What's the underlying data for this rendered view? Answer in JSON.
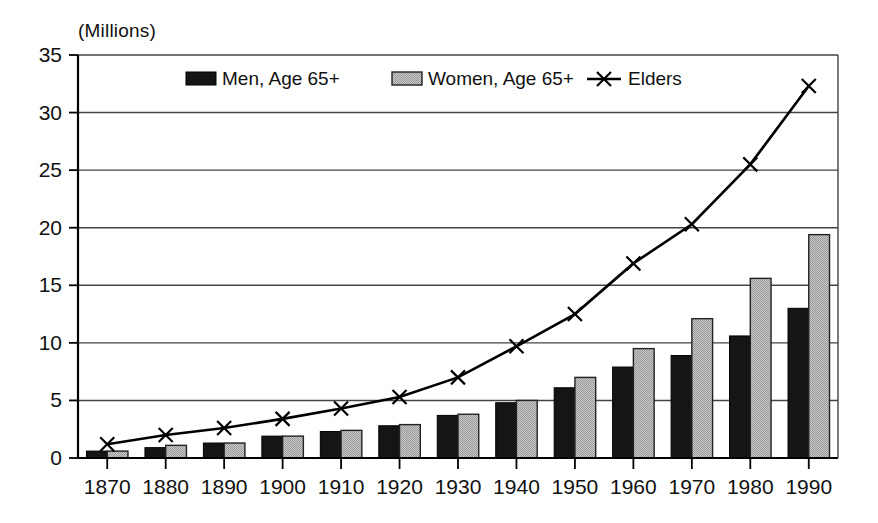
{
  "chart_data": {
    "type": "bar",
    "title": "",
    "subtitle": "",
    "unit_label": "(Millions)",
    "xlabel": "",
    "ylabel": "",
    "categories": [
      "1870",
      "1880",
      "1890",
      "1900",
      "1910",
      "1920",
      "1930",
      "1940",
      "1950",
      "1960",
      "1970",
      "1980",
      "1990"
    ],
    "ylim": [
      0,
      35
    ],
    "yticks": [
      0,
      5,
      10,
      15,
      20,
      25,
      30,
      35
    ],
    "ytick_labels": [
      "0",
      "5",
      "10",
      "15",
      "20",
      "25",
      "30",
      "35"
    ],
    "grid": true,
    "legend_position": "top-center",
    "series": [
      {
        "name": "Men, Age 65+",
        "type": "bar",
        "color": "#151515",
        "values": [
          0.6,
          0.9,
          1.3,
          1.9,
          2.3,
          2.8,
          3.7,
          4.8,
          6.1,
          7.9,
          8.9,
          10.6,
          13.0
        ]
      },
      {
        "name": "Women, Age 65+",
        "type": "bar",
        "color": "#b5b5b5",
        "values": [
          0.6,
          1.1,
          1.3,
          1.9,
          2.4,
          2.9,
          3.8,
          5.0,
          7.0,
          9.5,
          12.1,
          15.6,
          19.4
        ]
      },
      {
        "name": "Elders",
        "type": "line",
        "color": "#000000",
        "marker": "x",
        "values": [
          1.2,
          2.0,
          2.6,
          3.4,
          4.3,
          5.3,
          7.0,
          9.7,
          12.5,
          16.9,
          20.3,
          25.5,
          32.3
        ]
      }
    ]
  },
  "legend": {
    "items": [
      {
        "label": "Men, Age 65+",
        "marker": "filled-black-rect"
      },
      {
        "label": "Women, Age 65+",
        "marker": "gray-rect"
      },
      {
        "label": "Elders",
        "marker": "line-with-x"
      }
    ]
  }
}
